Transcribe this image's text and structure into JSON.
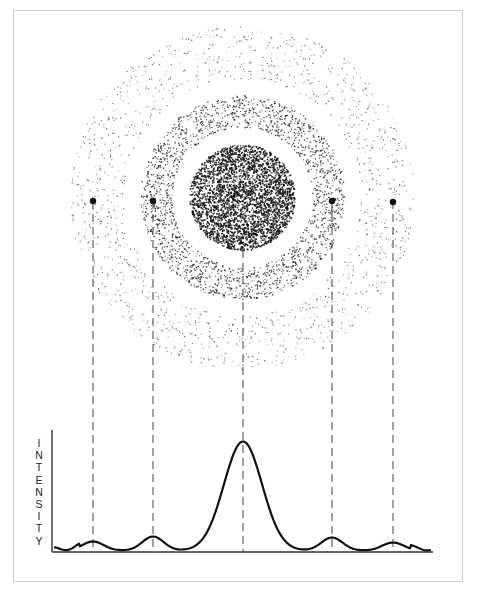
{
  "figure": {
    "type": "diffraction-pattern-diagram",
    "y_axis_label": "INTENSITY",
    "y_axis_letters": [
      "I",
      "N",
      "T",
      "E",
      "N",
      "S",
      "I",
      "T",
      "Y"
    ],
    "caption": "",
    "colors": {
      "ink": "#111111",
      "dash": "#555555",
      "frame": "#cfcfcf",
      "background": "#ffffff"
    }
  },
  "pattern": {
    "center": {
      "x": 242,
      "y": 197
    },
    "central_disk_radius": 53,
    "rings": [
      {
        "name": "first-ring",
        "inner_radius": 70,
        "outer_radius": 102,
        "density": 0.55
      },
      {
        "name": "second-ring",
        "inner_radius": 118,
        "outer_radius": 172,
        "density": 0.28
      }
    ],
    "markers": [
      {
        "name": "marker-left-outer",
        "x": 93,
        "y": 201
      },
      {
        "name": "marker-left-inner",
        "x": 153,
        "y": 201
      },
      {
        "name": "marker-right-inner",
        "x": 332,
        "y": 201
      },
      {
        "name": "marker-right-outer",
        "x": 393,
        "y": 202
      }
    ]
  },
  "profile": {
    "baseline_y": 552,
    "x_axis": {
      "x1": 52,
      "x2": 433
    },
    "y_axis": {
      "y1": 430,
      "y2": 552
    },
    "guides_x": [
      93,
      153,
      243,
      332,
      393
    ],
    "peaks": [
      {
        "x": 93,
        "height": 9
      },
      {
        "x": 153,
        "height": 14
      },
      {
        "x": 243,
        "height": 109
      },
      {
        "x": 332,
        "height": 13
      },
      {
        "x": 393,
        "height": 8
      }
    ]
  }
}
